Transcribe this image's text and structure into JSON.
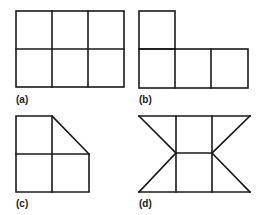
{
  "figure": {
    "stroke_color": "#1a1a1a",
    "background": "#ffffff",
    "panels": [
      {
        "id": "a",
        "label": "(a)",
        "shape": "2x3 grid of six squares"
      },
      {
        "id": "b",
        "label": "(b)",
        "shape": "L-shape of four squares: one square on top-left above a row of three"
      },
      {
        "id": "c",
        "label": "(c)",
        "shape": "2x2 squares with top-right square replaced by a right triangle (diagonal from top-middle to right-middle)"
      },
      {
        "id": "d",
        "label": "(d)",
        "shape": "column of two squares flanked by four triangles forming an hourglass/bow-tie outline"
      }
    ]
  }
}
